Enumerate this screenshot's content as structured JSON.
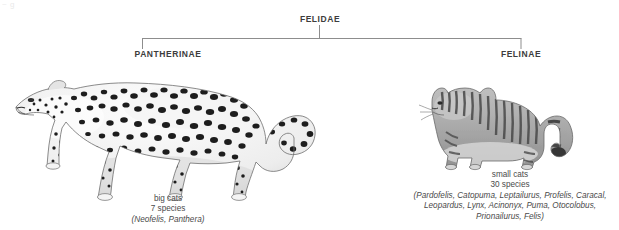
{
  "figure": {
    "scan_artifact_text": "~ g",
    "background_color": "#ffffff",
    "line_color": "#8d8d8d"
  },
  "cladogram": {
    "root": {
      "label": "FELIDAE",
      "rank": "family"
    },
    "branches": [
      {
        "label": "PANTHERINAE",
        "rank": "subfamily",
        "common_name": "big cats",
        "species_count": "7 species",
        "genera": "(Neofelis, Panthera)",
        "illustration": "leopard-illustration"
      },
      {
        "label": "FELINAE",
        "rank": "subfamily",
        "common_name": "small cats",
        "species_count": "30 species",
        "genera_lines": [
          "(Pardofelis, Catopuma, Leptailurus, Profelis, Caracal,",
          "Leopardus, Lynx, Acinonyx, Puma, Otocolobus,",
          "Prionailurus, Felis)"
        ],
        "illustration": "wildcat-illustration"
      }
    ]
  }
}
